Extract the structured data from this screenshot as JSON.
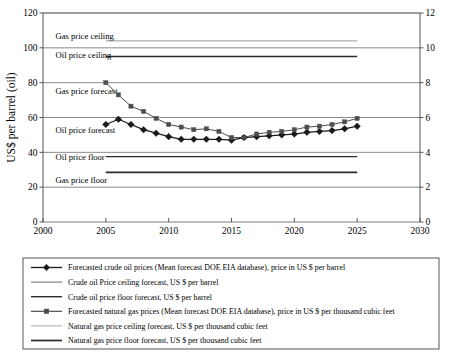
{
  "chart_data": {
    "type": "line",
    "title": "",
    "xlabel": "",
    "ylabel": "US$ per barrel (oil)",
    "ylabel_right": "",
    "xlim": [
      2000,
      2030
    ],
    "ylim": [
      0,
      120
    ],
    "ylim_right": [
      0,
      12
    ],
    "xticks": [
      "2000",
      "2005",
      "2010",
      "2015",
      "2020",
      "2025",
      "2030"
    ],
    "xtick_values": [
      2000,
      2005,
      2010,
      2015,
      2020,
      2025,
      2030
    ],
    "yticks_left": [
      "0",
      "20",
      "40",
      "60",
      "80",
      "100",
      "120"
    ],
    "ytick_values_left": [
      0,
      20,
      40,
      60,
      80,
      100,
      120
    ],
    "yticks_right": [
      "0",
      "2",
      "4",
      "6",
      "8",
      "10",
      "12"
    ],
    "ytick_values_right": [
      0,
      2,
      4,
      6,
      8,
      10,
      12
    ],
    "grid": true,
    "legend_position": "bottom",
    "x": [
      2005,
      2006,
      2007,
      2008,
      2009,
      2010,
      2011,
      2012,
      2013,
      2014,
      2015,
      2016,
      2017,
      2018,
      2019,
      2020,
      2021,
      2022,
      2023,
      2024,
      2025
    ],
    "series": [
      {
        "name": "Forecasted crude oil prices (Mean forecast DOE EIA database), price in US $ per barrel",
        "axis": "left",
        "marker": "diamond",
        "color": "#1a1a1a",
        "values": [
          56.0,
          59.0,
          56.0,
          53.0,
          51.0,
          49.0,
          47.5,
          47.5,
          47.5,
          47.5,
          47.0,
          48.5,
          49.0,
          49.5,
          50.0,
          50.5,
          51.5,
          52.0,
          52.5,
          53.5,
          55.0
        ]
      },
      {
        "name": "Forecasted natural gas prices (Mean forecast DOE EIA database), price in US $ per thousand cubic feet",
        "axis": "right",
        "marker": "square",
        "color": "#4d4d4d",
        "values": [
          8.0,
          7.3,
          6.65,
          6.35,
          5.95,
          5.6,
          5.45,
          5.3,
          5.35,
          5.2,
          4.85,
          4.85,
          5.05,
          5.15,
          5.2,
          5.3,
          5.45,
          5.5,
          5.6,
          5.75,
          5.95
        ]
      }
    ],
    "reference_lines": [
      {
        "name": "Gas price ceiling",
        "label": "Gas price ceiling",
        "axis": "right",
        "value": 10.4,
        "color": "#9a9a9a",
        "width": 1.0,
        "x_start": 2005,
        "x_end": 2025,
        "label_x": 2001.0,
        "label_y_px": 39
      },
      {
        "name": "Oil price ceiling",
        "label": "Oil price ceiling",
        "axis": "left",
        "value": 95.0,
        "color": "#2b2b2b",
        "width": 1.4,
        "x_start": 2005,
        "x_end": 2025,
        "label_x": 2001.0,
        "label_y_px": 58
      },
      {
        "name": "Gas price forecast",
        "label": "Gas price forecast",
        "axis": "left",
        "value": 0,
        "color": "none",
        "width": 0,
        "x_start": 0,
        "x_end": 0,
        "label_x": 2001.0,
        "label_y_px": 94
      },
      {
        "name": "Oil price forecast",
        "label": "Oil price forecast",
        "axis": "left",
        "value": 0,
        "color": "none",
        "width": 0,
        "x_start": 0,
        "x_end": 0,
        "label_x": 2001.0,
        "label_y_px": 133
      },
      {
        "name": "Oil price floor",
        "label": "Oil price floor",
        "axis": "left",
        "value": 37.5,
        "color": "#2b2b2b",
        "width": 1.3,
        "x_start": 2005,
        "x_end": 2025,
        "label_x": 2001.0,
        "label_y_px": 160
      },
      {
        "name": "Gas price floor",
        "label": "Gas price floor",
        "axis": "left",
        "value": 28.5,
        "color": "#2b2b2b",
        "width": 1.6,
        "x_start": 2005,
        "x_end": 2025,
        "label_x": 2001.0,
        "label_y_px": 183
      }
    ],
    "annotations": [
      "Gas price ceiling",
      "Oil price ceiling",
      "Gas price forecast",
      "Oil price forecast",
      "Oil price floor",
      "Gas price floor"
    ]
  },
  "legend": {
    "items": [
      {
        "label": "Forecasted crude oil prices (Mean forecast DOE EIA database), price in US $ per barrel",
        "marker": "diamond",
        "color": "#1a1a1a",
        "line_width": 1.3
      },
      {
        "label": "Crude oil Price ceiling forecast, US $ per barrel",
        "marker": "none",
        "color": "#6e6e6e",
        "line_width": 1.0
      },
      {
        "label": "Crude oil price floor forecast, US $ per barrel",
        "marker": "none",
        "color": "#2b2b2b",
        "line_width": 1.4
      },
      {
        "label": "Forecasted natural gas prices (Mean forecast DOE EIA database), price in US $ per thousand cubic feet",
        "marker": "square",
        "color": "#4d4d4d",
        "line_width": 1.2
      },
      {
        "label": "Natural gas price ceiling forecast, US $ per thousand cubic feet",
        "marker": "none",
        "color": "#a8a8a8",
        "line_width": 1.0
      },
      {
        "label": "Natural gas price floor forecast, US $ per thousand cubic feet",
        "marker": "none",
        "color": "#2b2b2b",
        "line_width": 1.7
      }
    ]
  },
  "colors": {
    "axis": "#555555",
    "grid": "#6b6b6b",
    "text": "#000000",
    "background": "#ffffff"
  }
}
